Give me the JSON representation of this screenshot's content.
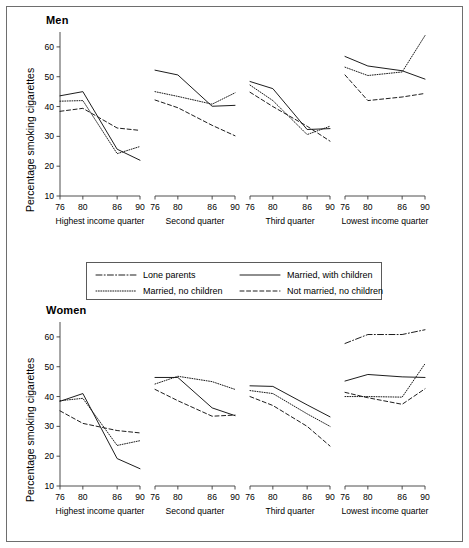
{
  "figure": {
    "men_title": "Men",
    "women_title": "Women",
    "ylabel": "Percentage smoking cigarettes"
  },
  "legend": {
    "position": "between-panels",
    "entries": [
      {
        "label": "Lone parents",
        "style": "dashdot"
      },
      {
        "label": "Married, with children",
        "style": "solid"
      },
      {
        "label": "Married, no children",
        "style": "dotted"
      },
      {
        "label": "Not married, no children",
        "style": "dashed"
      }
    ]
  },
  "axis": {
    "y_ticks": [
      60,
      50,
      40,
      30,
      20,
      10
    ],
    "y_min": 10,
    "y_max": 65,
    "x_ticks": [
      76,
      80,
      86,
      90
    ],
    "x_min": 76,
    "x_max": 90
  },
  "panels": [
    {
      "caption": "Highest income quarter"
    },
    {
      "caption": "Second quarter"
    },
    {
      "caption": "Third quarter"
    },
    {
      "caption": "Lowest income quarter"
    }
  ],
  "chart_data": {
    "type": "line",
    "xlabel": "",
    "ylabel": "Percentage smoking cigarettes",
    "x": [
      76,
      80,
      86,
      90
    ],
    "xtick_labels": [
      "76",
      "80",
      "86",
      "90"
    ],
    "ylim": [
      10,
      65
    ],
    "ytick_labels": [
      "10",
      "20",
      "30",
      "40",
      "50",
      "60"
    ],
    "grid": false,
    "legend_position": "center-between-rows",
    "panel_rows": [
      "Men",
      "Women"
    ],
    "panel_columns": [
      "Highest income quarter",
      "Second quarter",
      "Third quarter",
      "Lowest income quarter"
    ],
    "panels": [
      {
        "row": "Men",
        "column": "Highest income quarter",
        "series": [
          {
            "name": "Lone parents",
            "style": "dashdot",
            "values": [
              null,
              null,
              null,
              null
            ]
          },
          {
            "name": "Married, with children",
            "style": "solid",
            "values": [
              43.6,
              45.0,
              25.7,
              22.0
            ]
          },
          {
            "name": "Married, no children",
            "style": "dotted",
            "values": [
              41.8,
              42.0,
              24.2,
              26.6
            ]
          },
          {
            "name": "Not married, no children",
            "style": "dashed",
            "values": [
              38.4,
              39.4,
              32.8,
              32.0
            ]
          }
        ]
      },
      {
        "row": "Men",
        "column": "Second quarter",
        "series": [
          {
            "name": "Lone parents",
            "style": "dashdot",
            "values": [
              null,
              null,
              null,
              null
            ]
          },
          {
            "name": "Married, with children",
            "style": "solid",
            "values": [
              52.2,
              50.6,
              40.1,
              40.4
            ]
          },
          {
            "name": "Married, no children",
            "style": "dotted",
            "values": [
              45.0,
              43.4,
              40.8,
              44.6
            ]
          },
          {
            "name": "Not married, no children",
            "style": "dashed",
            "values": [
              42.2,
              39.6,
              33.7,
              30.2
            ]
          }
        ]
      },
      {
        "row": "Men",
        "column": "Third quarter",
        "series": [
          {
            "name": "Lone parents",
            "style": "dashdot",
            "values": [
              null,
              null,
              null,
              null
            ]
          },
          {
            "name": "Married, with children",
            "style": "solid",
            "values": [
              48.4,
              46.0,
              32.3,
              32.6
            ]
          },
          {
            "name": "Married, no children",
            "style": "dotted",
            "values": [
              47.2,
              42.0,
              30.6,
              33.4
            ]
          },
          {
            "name": "Not married, no children",
            "style": "dashed",
            "values": [
              44.8,
              40.0,
              33.4,
              28.4
            ]
          }
        ]
      },
      {
        "row": "Men",
        "column": "Lowest income quarter",
        "series": [
          {
            "name": "Lone parents",
            "style": "dashdot",
            "values": [
              null,
              null,
              null,
              null
            ]
          },
          {
            "name": "Married, with children",
            "style": "solid",
            "values": [
              56.8,
              53.6,
              52.0,
              49.2
            ]
          },
          {
            "name": "Married, no children",
            "style": "dotted",
            "values": [
              53.2,
              50.4,
              51.6,
              63.8
            ]
          },
          {
            "name": "Not married, no children",
            "style": "dashed",
            "values": [
              50.6,
              42.0,
              43.2,
              44.4
            ]
          }
        ]
      },
      {
        "row": "Women",
        "column": "Highest income quarter",
        "series": [
          {
            "name": "Lone parents",
            "style": "dashdot",
            "values": [
              null,
              null,
              null,
              null
            ]
          },
          {
            "name": "Married, with children",
            "style": "solid",
            "values": [
              38.4,
              41.0,
              19.2,
              15.8
            ]
          },
          {
            "name": "Married, no children",
            "style": "dotted",
            "values": [
              38.6,
              39.4,
              23.6,
              25.2
            ]
          },
          {
            "name": "Not married, no children",
            "style": "dashed",
            "values": [
              35.2,
              31.0,
              28.6,
              27.8
            ]
          }
        ]
      },
      {
        "row": "Women",
        "column": "Second quarter",
        "series": [
          {
            "name": "Lone parents",
            "style": "dashdot",
            "values": [
              null,
              null,
              null,
              null
            ]
          },
          {
            "name": "Married, with children",
            "style": "solid",
            "values": [
              46.4,
              46.4,
              36.2,
              33.6
            ]
          },
          {
            "name": "Married, no children",
            "style": "dotted",
            "values": [
              44.2,
              46.8,
              45.0,
              42.4
            ]
          },
          {
            "name": "Not married, no children",
            "style": "dashed",
            "values": [
              42.4,
              38.6,
              33.4,
              33.8
            ]
          }
        ]
      },
      {
        "row": "Women",
        "column": "Third quarter",
        "series": [
          {
            "name": "Lone parents",
            "style": "dashdot",
            "values": [
              null,
              null,
              null,
              null
            ]
          },
          {
            "name": "Married, with children",
            "style": "solid",
            "values": [
              43.6,
              43.4,
              37.2,
              33.2
            ]
          },
          {
            "name": "Married, no children",
            "style": "dotted",
            "values": [
              42.0,
              41.0,
              34.2,
              30.0
            ]
          },
          {
            "name": "Not married, no children",
            "style": "dashed",
            "values": [
              40.0,
              37.0,
              30.0,
              23.4
            ]
          }
        ]
      },
      {
        "row": "Women",
        "column": "Lowest income quarter",
        "series": [
          {
            "name": "Lone parents",
            "style": "dashdot",
            "values": [
              57.8,
              60.8,
              60.8,
              62.4
            ]
          },
          {
            "name": "Married, with children",
            "style": "solid",
            "values": [
              45.2,
              47.4,
              46.6,
              46.4
            ]
          },
          {
            "name": "Married, no children",
            "style": "dotted",
            "values": [
              40.0,
              40.0,
              39.8,
              51.0
            ]
          },
          {
            "name": "Not married, no children",
            "style": "dashed",
            "values": [
              41.4,
              39.6,
              37.4,
              42.6
            ]
          }
        ]
      }
    ]
  }
}
